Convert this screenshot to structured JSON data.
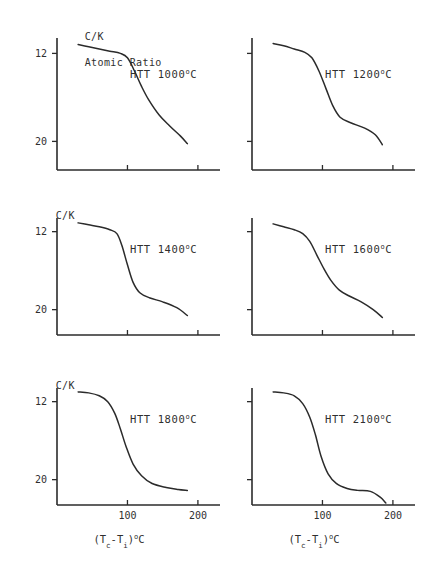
{
  "figure": {
    "y_axis_caption_line1": "C/K",
    "y_axis_caption_line2": "Atomic Ratio",
    "x_axis_caption": "(T",
    "x_axis_caption_sub1": "c",
    "x_axis_caption_mid": "-T",
    "x_axis_caption_sub2": "i",
    "x_axis_caption_end": ")",
    "x_axis_caption_deg": "o",
    "x_axis_caption_unit": "C",
    "line_color": "#2b2b2b",
    "background_color": "#ffffff"
  },
  "chart_data": {
    "type": "line",
    "xlabel": "(Tc-Ti) oC",
    "ylabel": "C/K Atomic Ratio",
    "xlim": [
      0,
      220
    ],
    "ylim_note": "y axis is inverted: value 12 is plotted above value 20",
    "yticks": [
      12,
      20
    ],
    "xticks": [
      100,
      200
    ],
    "grid": false,
    "legend": "none (panel annotation instead)",
    "panels": [
      {
        "label": "HTT 1000",
        "label_degree": "o",
        "label_unit": "C",
        "row": 0,
        "col": 0,
        "show_yticks": true,
        "show_xticks": false,
        "show_ylabel_caption": true,
        "x": [
          30,
          45,
          60,
          75,
          90,
          100,
          110,
          120,
          130,
          145,
          160,
          175,
          185
        ],
        "y": [
          11.2,
          11.4,
          11.6,
          11.8,
          12.0,
          12.4,
          13.6,
          15.0,
          16.2,
          17.6,
          18.6,
          19.5,
          20.2
        ]
      },
      {
        "label": "HTT 1200",
        "label_degree": "o",
        "label_unit": "C",
        "row": 0,
        "col": 1,
        "show_yticks": false,
        "show_xticks": false,
        "show_ylabel_caption": false,
        "x": [
          30,
          45,
          60,
          75,
          85,
          95,
          105,
          115,
          125,
          140,
          160,
          175,
          185
        ],
        "y": [
          11.1,
          11.3,
          11.6,
          11.9,
          12.4,
          13.6,
          15.2,
          16.8,
          17.8,
          18.3,
          18.8,
          19.4,
          20.3
        ]
      },
      {
        "label": "HTT 1400",
        "label_degree": "o",
        "label_unit": "C",
        "row": 1,
        "col": 0,
        "show_yticks": true,
        "show_xticks": false,
        "show_ylabel_caption": true,
        "x": [
          30,
          45,
          60,
          75,
          85,
          92,
          100,
          108,
          118,
          132,
          150,
          170,
          185
        ],
        "y": [
          11.1,
          11.3,
          11.5,
          11.8,
          12.2,
          13.4,
          15.4,
          17.2,
          18.3,
          18.8,
          19.2,
          19.8,
          20.6
        ]
      },
      {
        "label": "HTT 1600",
        "label_degree": "o",
        "label_unit": "C",
        "row": 1,
        "col": 1,
        "show_yticks": false,
        "show_xticks": false,
        "show_ylabel_caption": false,
        "x": [
          30,
          45,
          60,
          72,
          82,
          92,
          102,
          112,
          124,
          138,
          155,
          172,
          185
        ],
        "y": [
          11.2,
          11.5,
          11.8,
          12.2,
          13.0,
          14.4,
          15.8,
          17.0,
          18.0,
          18.6,
          19.2,
          20.0,
          20.8
        ]
      },
      {
        "label": "HTT 1800",
        "label_degree": "o",
        "label_unit": "C",
        "row": 2,
        "col": 0,
        "show_yticks": true,
        "show_xticks": true,
        "show_ylabel_caption": true,
        "x": [
          30,
          45,
          60,
          72,
          82,
          90,
          98,
          108,
          120,
          135,
          155,
          172,
          185
        ],
        "y": [
          11.0,
          11.1,
          11.4,
          12.0,
          13.2,
          14.8,
          16.6,
          18.4,
          19.6,
          20.4,
          20.8,
          21.0,
          21.1
        ]
      },
      {
        "label": "HTT 2100",
        "label_degree": "o",
        "label_unit": "C",
        "row": 2,
        "col": 1,
        "show_yticks": false,
        "show_xticks": true,
        "show_ylabel_caption": false,
        "x": [
          30,
          45,
          60,
          72,
          82,
          90,
          98,
          108,
          120,
          135,
          150,
          168,
          182,
          190
        ],
        "y": [
          11.0,
          11.1,
          11.4,
          12.2,
          13.6,
          15.4,
          17.6,
          19.4,
          20.4,
          20.9,
          21.1,
          21.2,
          21.8,
          22.4
        ]
      }
    ]
  }
}
